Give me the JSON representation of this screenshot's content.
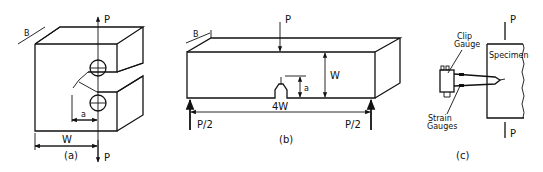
{
  "figure_a": {
    "caption": "(a)",
    "labels": {
      "load_top": "P",
      "load_bottom": "P",
      "thickness": "B",
      "crack_length": "a",
      "width": "W"
    }
  },
  "figure_b": {
    "caption": "(b)",
    "labels": {
      "load_center": "P",
      "thickness": "B",
      "height": "W",
      "crack_length": "a",
      "span": "4W",
      "support_left": "P/2",
      "support_right": "P/2"
    }
  },
  "figure_c": {
    "caption": "(c)",
    "labels": {
      "load_top": "P",
      "load_bottom": "P",
      "clip_gauge": "Clip\nGauge",
      "clip_line1": "Clip",
      "clip_line2": "Gauge",
      "strain_line1": "Strain",
      "strain_line2": "Gauges",
      "specimen": "Specimen"
    }
  }
}
